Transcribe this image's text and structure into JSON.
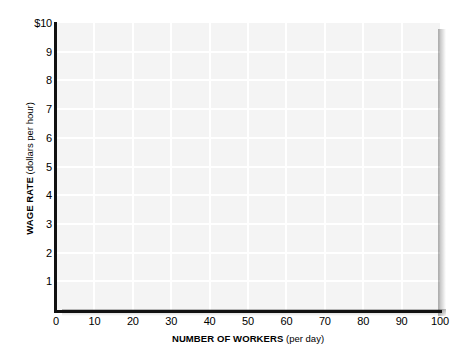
{
  "chart_data": {
    "type": "line",
    "title": "",
    "subtitle": "",
    "xlabel_strong": "NUMBER OF WORKERS",
    "xlabel_paren": "(per day)",
    "ylabel_strong": "WAGE RATE",
    "ylabel_paren": "(dollars per hour)",
    "xlim": [
      0,
      100
    ],
    "ylim": [
      0,
      10
    ],
    "x_ticks": [
      0,
      10,
      20,
      30,
      40,
      50,
      60,
      70,
      80,
      90,
      100
    ],
    "x_tick_labels": [
      "0",
      "10",
      "20",
      "30",
      "40",
      "50",
      "60",
      "70",
      "80",
      "90",
      "100"
    ],
    "y_ticks": [
      1,
      2,
      3,
      4,
      5,
      6,
      7,
      8,
      9,
      10
    ],
    "y_tick_labels": [
      "1",
      "2",
      "3",
      "4",
      "5",
      "6",
      "7",
      "8",
      "9",
      "$10"
    ],
    "grid": true,
    "grid_color": "#ffffff",
    "plot_background": "#f4f4f4",
    "axis_color": "#111111",
    "legend": [],
    "annotations": [],
    "series": [],
    "values": [],
    "categories": [],
    "note": "Blank grid template; no data series plotted."
  }
}
